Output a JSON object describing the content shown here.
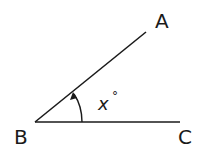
{
  "diagram": {
    "type": "angle",
    "points": {
      "A": {
        "label": "A",
        "x": 146,
        "y": 32
      },
      "B": {
        "label": "B",
        "x": 35,
        "y": 122
      },
      "C": {
        "label": "C",
        "x": 180,
        "y": 122
      }
    },
    "angle_label": "x",
    "angle_unit": "°",
    "stroke_color": "#1a1a1a"
  }
}
